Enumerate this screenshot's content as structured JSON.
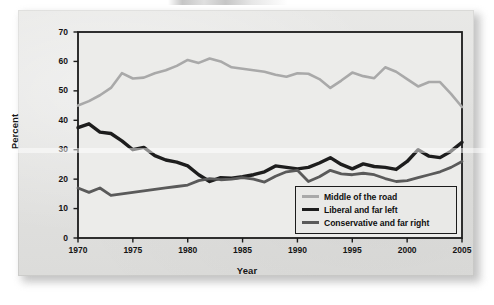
{
  "figure": {
    "background_color": "#ffffff",
    "panel_color": "#e3e3e1"
  },
  "axes": {
    "ylabel": "Percent",
    "xlabel": "Year",
    "yticks": [
      "0",
      "10",
      "20",
      "30",
      "40",
      "50",
      "60",
      "70"
    ],
    "xticks": [
      "1970",
      "1975",
      "1980",
      "1985",
      "1990",
      "1995",
      "2000",
      "2005"
    ]
  },
  "legend": {
    "items": [
      {
        "label": "Middle of the road",
        "color": "#a9a9a9",
        "width": 2.6
      },
      {
        "label": "Liberal and far left",
        "color": "#1d1d1d",
        "width": 3.4
      },
      {
        "label": "Conservative and far right",
        "color": "#5a5a5a",
        "width": 2.8
      }
    ]
  },
  "chart_data": {
    "type": "line",
    "title": "",
    "subtitle": "",
    "xlabel": "Year",
    "ylabel": "Percent",
    "xlim": [
      1970,
      2005
    ],
    "ylim": [
      0,
      70
    ],
    "ytick_step": 10,
    "xtick_step": 5,
    "grid": false,
    "legend_position": "bottom-right",
    "x": [
      1970,
      1971,
      1972,
      1973,
      1974,
      1975,
      1976,
      1977,
      1978,
      1979,
      1980,
      1981,
      1982,
      1983,
      1984,
      1985,
      1986,
      1987,
      1988,
      1989,
      1990,
      1991,
      1992,
      1993,
      1994,
      1995,
      1996,
      1997,
      1998,
      1999,
      2000,
      2001,
      2002,
      2003,
      2004,
      2005
    ],
    "series": [
      {
        "name": "Middle of the road",
        "color": "#a9a9a9",
        "values": [
          45.0,
          46.5,
          48.5,
          51.0,
          56.0,
          54.2,
          54.5,
          56.0,
          57.0,
          58.5,
          60.5,
          59.5,
          61.0,
          60.0,
          58.0,
          57.5,
          57.0,
          56.5,
          55.5,
          54.8,
          56.0,
          55.8,
          54.0,
          51.0,
          53.5,
          56.2,
          55.0,
          54.3,
          58.0,
          56.5,
          54.0,
          51.5,
          53.0,
          53.0,
          49.0,
          44.5
        ]
      },
      {
        "name": "Liberal and far left",
        "color": "#1d1d1d",
        "values": [
          37.5,
          38.8,
          36.0,
          35.5,
          33.0,
          30.0,
          30.8,
          28.0,
          26.5,
          25.8,
          24.5,
          21.5,
          19.2,
          20.5,
          20.3,
          20.8,
          21.5,
          22.5,
          24.5,
          24.0,
          23.5,
          24.0,
          25.5,
          27.3,
          25.0,
          23.5,
          25.2,
          24.3,
          24.0,
          23.3,
          26.0,
          30.0,
          27.8,
          27.3,
          29.5,
          32.5
        ]
      },
      {
        "name": "Conservative and far right",
        "color": "#5a5a5a",
        "values": [
          17.0,
          15.5,
          17.0,
          14.5,
          15.0,
          15.5,
          16.0,
          16.5,
          17.0,
          17.5,
          18.0,
          19.5,
          20.2,
          19.8,
          20.0,
          20.5,
          20.0,
          19.0,
          21.0,
          22.5,
          23.0,
          19.2,
          20.8,
          23.0,
          21.8,
          21.5,
          22.0,
          21.5,
          20.2,
          19.2,
          19.5,
          20.5,
          21.5,
          22.5,
          24.0,
          26.0
        ]
      }
    ]
  }
}
